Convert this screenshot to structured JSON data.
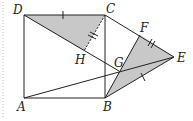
{
  "diagram": {
    "type": "geometry",
    "labels": {
      "A": "A",
      "B": "B",
      "C": "C",
      "D": "D",
      "E": "E",
      "F": "F",
      "G": "G",
      "H": "H"
    },
    "points": {
      "A": [
        24,
        98
      ],
      "B": [
        105,
        98
      ],
      "C": [
        105,
        15
      ],
      "D": [
        24,
        15
      ],
      "E": [
        174,
        57
      ],
      "F": [
        140,
        35
      ],
      "G": [
        119,
        71
      ],
      "H": [
        84,
        51
      ]
    },
    "shaded_regions": [
      "triangle DCH",
      "triangle BGE/FGE region"
    ],
    "marks": {
      "single_tick": [
        "DC",
        "BE"
      ],
      "double_tick": [
        "CH",
        "FE"
      ]
    },
    "fill_color": "#c8c8c8",
    "line_color": "#222222"
  }
}
